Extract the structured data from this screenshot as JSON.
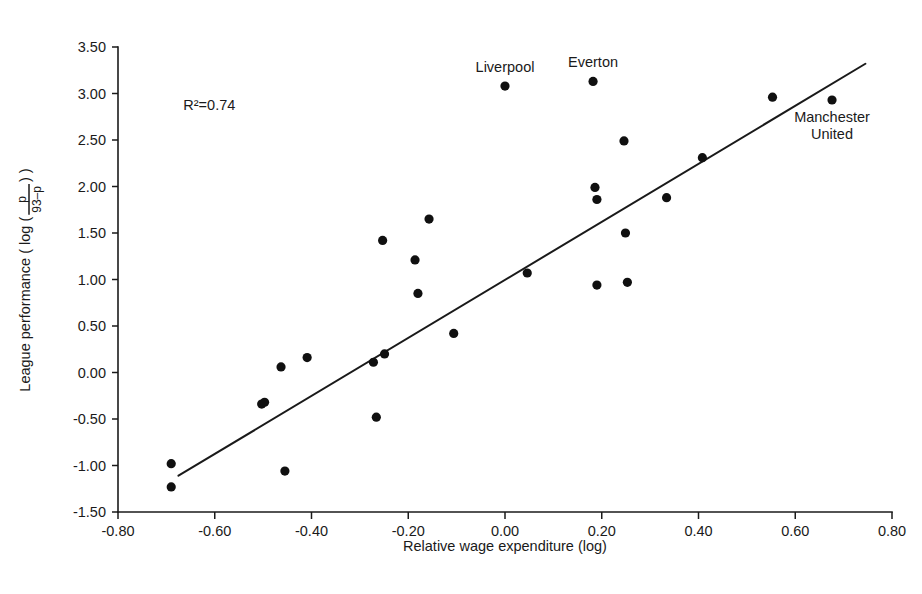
{
  "chart_data": {
    "type": "scatter",
    "title": "",
    "xlabel": "Relative wage expenditure (log)",
    "ylabel": "League performance ( log ( p/(93-p) ) )",
    "ylabel_parts": {
      "prefix": "League performance ( log (",
      "numerator": "p",
      "denominator": "93–p",
      "suffix": ") )"
    },
    "xlim": [
      -0.8,
      0.8
    ],
    "ylim": [
      -1.5,
      3.5
    ],
    "xticks": [
      "-0.80",
      "-0.60",
      "-0.40",
      "-0.20",
      "0.00",
      "0.20",
      "0.40",
      "0.60",
      "0.80"
    ],
    "xtick_values": [
      -0.8,
      -0.6,
      -0.4,
      -0.2,
      0.0,
      0.2,
      0.4,
      0.6,
      0.8
    ],
    "yticks": [
      "-1.50",
      "-1.00",
      "-0.50",
      "0.00",
      "0.50",
      "1.00",
      "1.50",
      "2.00",
      "2.50",
      "3.00",
      "3.50"
    ],
    "ytick_values": [
      -1.5,
      -1.0,
      -0.5,
      0.0,
      0.5,
      1.0,
      1.5,
      2.0,
      2.5,
      3.0,
      3.5
    ],
    "grid": false,
    "legend": "none",
    "r_squared_label": "R²=0.74",
    "r_squared": 0.74,
    "point_color": "#101010",
    "line_color": "#1a1a1a",
    "background_color": "#ffffff",
    "points": [
      {
        "x": -0.69,
        "y": -0.98,
        "label": ""
      },
      {
        "x": -0.69,
        "y": -1.23,
        "label": ""
      },
      {
        "x": -0.503,
        "y": -0.34,
        "label": ""
      },
      {
        "x": -0.497,
        "y": -0.32,
        "label": ""
      },
      {
        "x": -0.463,
        "y": 0.06,
        "label": ""
      },
      {
        "x": -0.455,
        "y": -1.06,
        "label": ""
      },
      {
        "x": -0.409,
        "y": 0.16,
        "label": ""
      },
      {
        "x": -0.272,
        "y": 0.11,
        "label": ""
      },
      {
        "x": -0.266,
        "y": -0.48,
        "label": ""
      },
      {
        "x": -0.253,
        "y": 1.42,
        "label": ""
      },
      {
        "x": -0.249,
        "y": 0.2,
        "label": ""
      },
      {
        "x": -0.186,
        "y": 1.21,
        "label": ""
      },
      {
        "x": -0.18,
        "y": 0.85,
        "label": ""
      },
      {
        "x": -0.157,
        "y": 1.65,
        "label": ""
      },
      {
        "x": -0.106,
        "y": 0.42,
        "label": ""
      },
      {
        "x": 0.0,
        "y": 3.08,
        "label": "Liverpool"
      },
      {
        "x": 0.046,
        "y": 1.07,
        "label": ""
      },
      {
        "x": 0.182,
        "y": 3.13,
        "label": "Everton"
      },
      {
        "x": 0.186,
        "y": 1.99,
        "label": ""
      },
      {
        "x": 0.19,
        "y": 1.86,
        "label": ""
      },
      {
        "x": 0.19,
        "y": 0.94,
        "label": ""
      },
      {
        "x": 0.246,
        "y": 2.49,
        "label": ""
      },
      {
        "x": 0.249,
        "y": 1.5,
        "label": ""
      },
      {
        "x": 0.253,
        "y": 0.97,
        "label": ""
      },
      {
        "x": 0.334,
        "y": 1.88,
        "label": ""
      },
      {
        "x": 0.408,
        "y": 2.31,
        "label": ""
      },
      {
        "x": 0.553,
        "y": 2.96,
        "label": ""
      },
      {
        "x": 0.676,
        "y": 2.93,
        "label": "Manchester United"
      }
    ],
    "trend_line": {
      "x1": -0.675,
      "y1": -1.11,
      "x2": 0.745,
      "y2": 3.32
    },
    "annotations": [
      {
        "text": "Liverpool",
        "x": 0.0,
        "y": 3.08,
        "position": "above"
      },
      {
        "text": "Everton",
        "x": 0.182,
        "y": 3.13,
        "position": "above"
      },
      {
        "text": "Manchester",
        "x": 0.676,
        "y": 2.93,
        "position": "below"
      },
      {
        "text": "United",
        "x": 0.676,
        "y": 2.93,
        "position": "below2"
      }
    ],
    "r2_annotation_position": {
      "x": -0.665,
      "y": 2.82
    }
  },
  "labels": {
    "liverpool": "Liverpool",
    "everton": "Everton",
    "manchester_line1": "Manchester",
    "manchester_line2": "United",
    "r_squared": "R²=0.74",
    "x_axis_title": "Relative wage expenditure (log)",
    "y_axis_prefix": "League performance ( log (",
    "y_axis_numerator": "p",
    "y_axis_denominator": "93–p",
    "y_axis_suffix": ") )"
  }
}
